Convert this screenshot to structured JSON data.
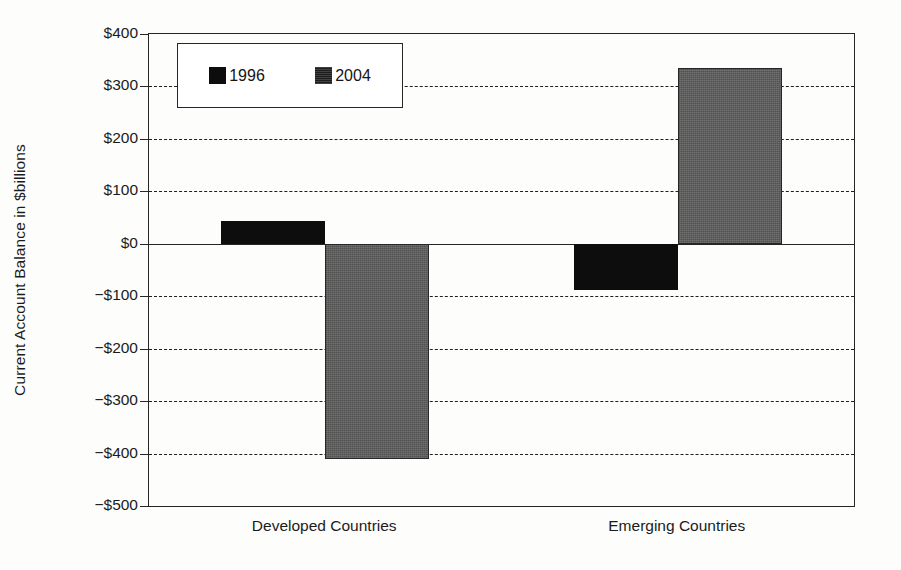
{
  "chart_data": {
    "type": "bar",
    "title": "",
    "xlabel": "",
    "ylabel": "Current Account Balance in $billions",
    "categories": [
      "Developed Countries",
      "Emerging Countries"
    ],
    "series": [
      {
        "name": "1996",
        "values": [
          43,
          -89
        ],
        "color": "#0d0d0d",
        "fill": "solid-black"
      },
      {
        "name": "2004",
        "values": [
          -410,
          335
        ],
        "color": "#5e5e5e",
        "fill": "gray-dither"
      }
    ],
    "ylim": [
      -500,
      400
    ],
    "ytick_values": [
      400,
      300,
      200,
      100,
      0,
      -100,
      -200,
      -300,
      -400,
      -500
    ],
    "ytick_labels": [
      "$400",
      "$300",
      "$200",
      "$100",
      "$0",
      "−$100",
      "−$200",
      "−$300",
      "−$400",
      "−$500"
    ],
    "grid": "horizontal-dashed",
    "zero_line": true,
    "legend_position": "upper-left-inside",
    "legend_entries": [
      "1996",
      "2004"
    ]
  },
  "legend": {
    "entries": [
      {
        "label": "1996",
        "swatch": "legend-swatch-1996"
      },
      {
        "label": "2004",
        "swatch": "legend-swatch-2004"
      }
    ]
  },
  "axis": {
    "y_title": "Current Account Balance in $billions",
    "y_labels": [
      "$400",
      "$300",
      "$200",
      "$100",
      "$0",
      "−$100",
      "−$200",
      "−$300",
      "−$400",
      "−$500"
    ],
    "x_labels": [
      "Developed Countries",
      "Emerging Countries"
    ]
  }
}
